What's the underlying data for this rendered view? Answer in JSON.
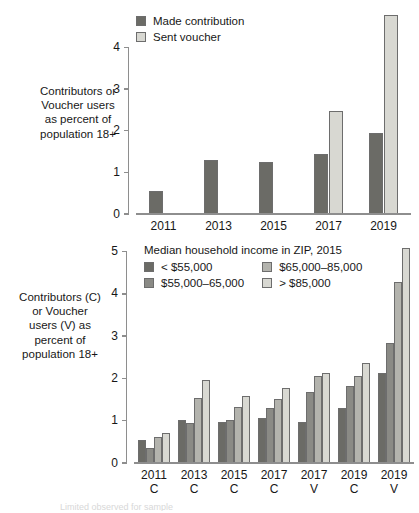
{
  "figure": {
    "background": "#ffffff",
    "partial_caption": "Limited observed for sample"
  },
  "palette": {
    "dark": "#6b6b66",
    "mid_dark": "#8a8a85",
    "mid_light": "#b3b3ad",
    "light": "#d8d8d2",
    "axis": "#8e8e8e",
    "text": "#171717"
  },
  "chart_data": [
    {
      "id": "top",
      "type": "bar",
      "title": "",
      "xlabel": "",
      "ylabel": "Contributors or\nVoucher users\nas percent of\npopulation 18+",
      "ylim": [
        0,
        4.95
      ],
      "yticks": [
        0,
        1,
        2,
        3,
        4
      ],
      "ytick_labels": [
        "0",
        "1",
        "2",
        "3",
        "4"
      ],
      "grid": false,
      "legend_position": "top-center",
      "categories": [
        "2011",
        "2013",
        "2015",
        "2017",
        "2019"
      ],
      "series": [
        {
          "name": "Made contribution",
          "color": "#6b6b66",
          "values": [
            0.55,
            1.3,
            1.24,
            1.44,
            1.95
          ]
        },
        {
          "name": "Sent voucher",
          "color": "#d8d8d2",
          "values": [
            0,
            0,
            0,
            2.47,
            4.79
          ]
        }
      ]
    },
    {
      "id": "bottom",
      "type": "bar",
      "title": "",
      "xlabel": "",
      "ylabel": "Contributors (C)\nor Voucher\nusers (V) as\npercent of\npopulation 18+",
      "ylim": [
        0,
        5.25
      ],
      "yticks": [
        0,
        1,
        2,
        3,
        4,
        5
      ],
      "ytick_labels": [
        "0",
        "1",
        "2",
        "3",
        "4",
        "5"
      ],
      "grid": false,
      "legend_title": "Median household income in ZIP, 2015",
      "legend_position": "inside-top-left",
      "categories": [
        "2011\nC",
        "2013\nC",
        "2015\nC",
        "2017\nC",
        "2017\nV",
        "2019\nC",
        "2019\nV"
      ],
      "series": [
        {
          "name": "< $55,000",
          "color": "#6b6b66",
          "values": [
            0.55,
            1.01,
            0.98,
            1.07,
            0.96,
            1.31,
            2.12
          ]
        },
        {
          "name": "$55,000–65,000",
          "color": "#8a8a85",
          "values": [
            0.35,
            0.94,
            1.02,
            1.29,
            1.67,
            1.82,
            2.85
          ]
        },
        {
          "name": "$65,000–85,000",
          "color": "#b3b3ad",
          "values": [
            0.62,
            1.54,
            1.32,
            1.52,
            2.05,
            2.05,
            4.27
          ]
        },
        {
          "name": "> $85,000",
          "color": "#d8d8d2",
          "values": [
            0.72,
            1.96,
            1.58,
            1.77,
            2.14,
            2.36,
            5.08
          ]
        }
      ]
    }
  ]
}
